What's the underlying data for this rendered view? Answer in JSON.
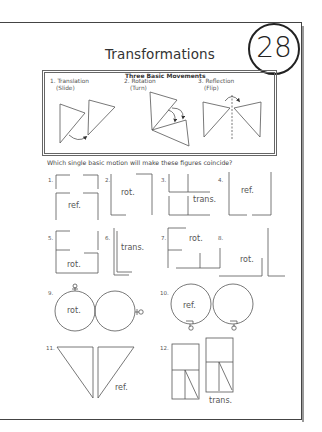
{
  "page": {
    "title": "Transformations",
    "page_number": "28"
  },
  "movements": {
    "heading": "Three Basic Movements",
    "items": [
      {
        "number": "1.",
        "name": "Translation",
        "alias": "(Slide)"
      },
      {
        "number": "2.",
        "name": "Rotation",
        "alias": "(Turn)"
      },
      {
        "number": "3.",
        "name": "Reflection",
        "alias": "(Flip)"
      }
    ]
  },
  "question": "Which single basic motion will make these figures coincide?",
  "problems": [
    {
      "number": "1.",
      "answer": "ref."
    },
    {
      "number": "2.",
      "answer": "rot."
    },
    {
      "number": "3.",
      "answer": "trans."
    },
    {
      "number": "4.",
      "answer": "ref."
    },
    {
      "number": "5.",
      "answer": "rot."
    },
    {
      "number": "6.",
      "answer": "trans."
    },
    {
      "number": "7.",
      "answer": "rot."
    },
    {
      "number": "8.",
      "answer": "rot."
    },
    {
      "number": "9.",
      "answer": "rot."
    },
    {
      "number": "10.",
      "answer": "ref."
    },
    {
      "number": "11.",
      "answer": "ref."
    },
    {
      "number": "12.",
      "answer": "trans."
    }
  ]
}
